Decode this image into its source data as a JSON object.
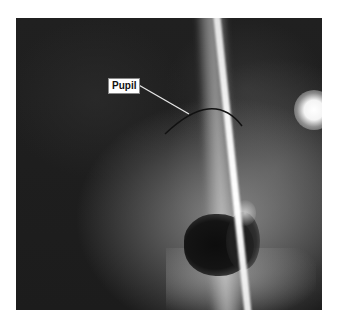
{
  "figure": {
    "type": "clinical slit-lamp photograph",
    "annotations": [
      {
        "label": "Pupil",
        "target": "pupil margin arc"
      }
    ],
    "colors": {
      "background": "#ffffff",
      "photo_dark": "#1a1a1a",
      "label_bg": "#ffffff",
      "label_text": "#111111",
      "leader_line": "#e6e6e6",
      "arc": "#111111"
    }
  }
}
